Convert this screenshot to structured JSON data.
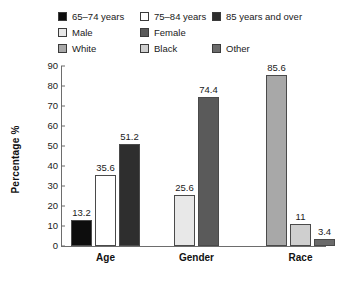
{
  "legend": {
    "rows": [
      [
        {
          "label": "65–74 years",
          "color": "#0d0d0d"
        },
        {
          "label": "75–84 years",
          "color": "#ffffff"
        },
        {
          "label": "85 years and over",
          "color": "#2e2e2e"
        }
      ],
      [
        {
          "label": "Male",
          "color": "#e8e8e8"
        },
        {
          "label": "Female",
          "color": "#5a5a5a"
        },
        {
          "label": "",
          "color": ""
        }
      ],
      [
        {
          "label": "White",
          "color": "#a8a8a8"
        },
        {
          "label": "Black",
          "color": "#cfcfcf"
        },
        {
          "label": "Other",
          "color": "#6b6b6b"
        }
      ]
    ]
  },
  "chart_data": {
    "type": "bar",
    "title": "",
    "xlabel": "",
    "ylabel": "Percentage %",
    "ylim": [
      0,
      90
    ],
    "yticks": [
      90,
      80,
      70,
      60,
      50,
      40,
      30,
      20,
      10,
      0
    ],
    "grid": false,
    "legend_position": "top",
    "categories": [
      "Age",
      "Gender",
      "Race"
    ],
    "groups": [
      {
        "category": "Age",
        "bars": [
          {
            "name": "65–74 years",
            "value": 13.2,
            "label": "13.2",
            "color": "#0d0d0d"
          },
          {
            "name": "75–84 years",
            "value": 35.6,
            "label": "35.6",
            "color": "#ffffff"
          },
          {
            "name": "85 years and over",
            "value": 51.2,
            "label": "51.2",
            "color": "#2e2e2e"
          }
        ]
      },
      {
        "category": "Gender",
        "bars": [
          {
            "name": "Male",
            "value": 25.6,
            "label": "25.6",
            "color": "#e8e8e8"
          },
          {
            "name": "Female",
            "value": 74.4,
            "label": "74.4",
            "color": "#5a5a5a"
          }
        ]
      },
      {
        "category": "Race",
        "bars": [
          {
            "name": "White",
            "value": 85.6,
            "label": "85.6",
            "color": "#a8a8a8"
          },
          {
            "name": "Black",
            "value": 11,
            "label": "11",
            "color": "#cfcfcf"
          },
          {
            "name": "Other",
            "value": 3.4,
            "label": "3.4",
            "color": "#6b6b6b"
          }
        ]
      }
    ]
  }
}
